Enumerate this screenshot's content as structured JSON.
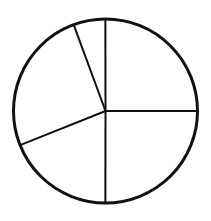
{
  "chart_data": {
    "type": "pie",
    "title": "",
    "labels": [
      "",
      "",
      "",
      "",
      ""
    ],
    "values": [
      25.0,
      5.6,
      25.4,
      18.9,
      25.0
    ],
    "start_angle_deg": 0,
    "direction": "counterclockwise",
    "legend": "none",
    "style": {
      "fill": "#ffffff",
      "stroke": "#111111"
    }
  },
  "geometry": {
    "cx": 105.5,
    "cy": 111,
    "r": 92
  }
}
